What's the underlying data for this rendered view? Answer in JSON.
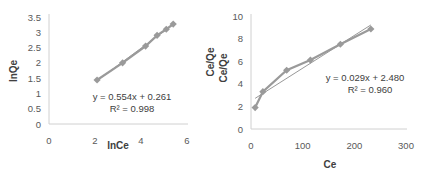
{
  "chart_data": [
    {
      "type": "scatter",
      "title": "",
      "xlabel": "lnCe",
      "ylabel": "lnQe",
      "xlim": [
        0,
        6
      ],
      "ylim": [
        0,
        3.5
      ],
      "xticks": [
        "0",
        "2",
        "4",
        "6"
      ],
      "yticks": [
        "0",
        "0.5",
        "1",
        "1.5",
        "2",
        "2.5",
        "3",
        "3.5"
      ],
      "grid": false,
      "series": [
        {
          "name": "data",
          "x": [
            2.09,
            3.2,
            4.2,
            4.7,
            5.1,
            5.4
          ],
          "y": [
            1.44,
            2.0,
            2.55,
            2.9,
            3.1,
            3.27
          ]
        }
      ],
      "trendline": {
        "slope": 0.554,
        "intercept": 0.261,
        "equation": "y = 0.554x + 0.261",
        "r2_label": "R² = 0.998"
      }
    },
    {
      "type": "line",
      "title": "",
      "xlabel": "Ce",
      "ylabel": "Ce/Qe",
      "ylabel_secondary": "Ce/Qe",
      "xlim": [
        0,
        300
      ],
      "ylim": [
        0,
        10
      ],
      "xticks": [
        "0",
        "100",
        "200",
        "300"
      ],
      "yticks": [
        "0",
        "2",
        "4",
        "6",
        "8",
        "10"
      ],
      "grid": false,
      "series": [
        {
          "name": "data",
          "x": [
            8,
            23,
            69,
            115,
            173,
            232
          ],
          "y": [
            1.9,
            3.3,
            5.2,
            6.1,
            7.5,
            8.85
          ]
        }
      ],
      "trendline": {
        "slope": 0.029,
        "intercept": 2.48,
        "equation": "y = 0.029x + 2.480",
        "r2_label": "R² = 0.960"
      }
    }
  ],
  "colors": {
    "series": "#9a9a9a",
    "trend": "#8c8c8c",
    "axis": "#bfbfbf",
    "text": "#595959"
  }
}
